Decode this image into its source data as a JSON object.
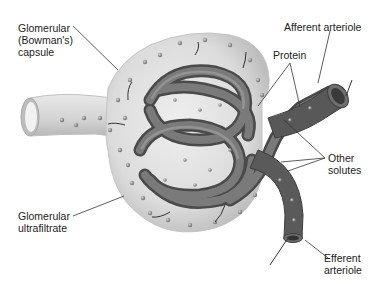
{
  "diagram": {
    "labels": {
      "capsule": "Glomerular\n(Bowman's)\ncapsule",
      "afferent": "Afferent arteriole",
      "protein": "Protein",
      "other_solutes": "Other\nsolutes",
      "ultrafiltrate": "Glomerular\nultrafiltrate",
      "efferent": "Efferent\narteriole"
    },
    "colors": {
      "capsule_fill": "#d9d9d9",
      "capsule_edge": "#bdbdbd",
      "vessel_dark": "#555555",
      "vessel_mid": "#707070",
      "particle": "#8a8a8a",
      "leader": "#333333",
      "text": "#222222"
    }
  }
}
